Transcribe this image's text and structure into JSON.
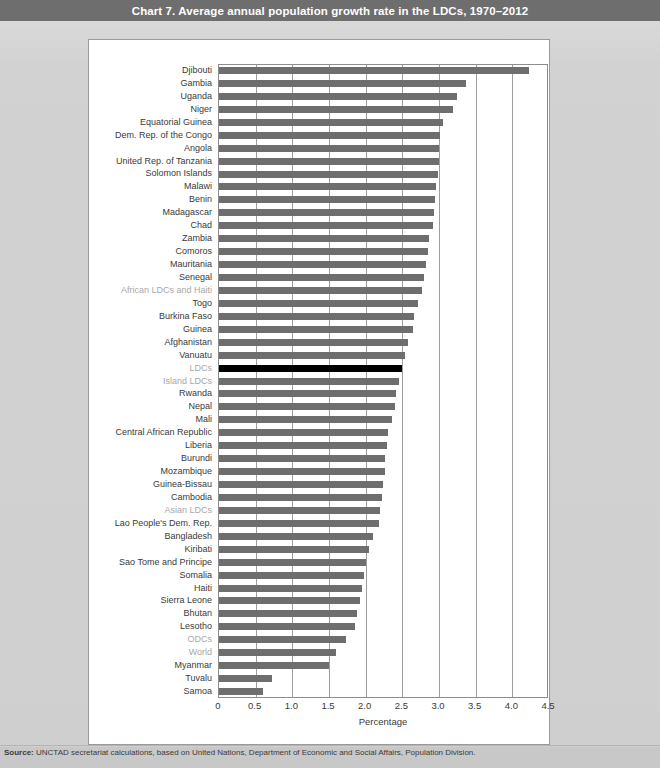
{
  "title": "Chart 7. Average annual population growth rate in the LDCs, 1970–2012",
  "source": {
    "prefix": "Source:",
    "text": "UNCTAD secretariat calculations, based on United Nations, Department of Economic and Social Affairs, Population Division."
  },
  "colors": {
    "title_bar_bg": "#6e6e6e",
    "title_bar_text": "#ffffff",
    "card_bg": "#d2d2d2",
    "plot_bg": "#ffffff",
    "bar": "#6e6e6e",
    "bar_highlight": "#000000",
    "aggregate_label": "#a8a8a8",
    "label": "#3a3a3a",
    "gridline": "#9e9e9e"
  },
  "chart_data": {
    "type": "bar",
    "orientation": "horizontal",
    "title": "Chart 7. Average annual population growth rate in the LDCs, 1970–2012",
    "xlabel": "Percentage",
    "ylabel": "",
    "xlim": [
      0,
      4.5
    ],
    "xticks": [
      "0",
      "0.5",
      "1.0",
      "1.5",
      "2.0",
      "2.5",
      "3.0",
      "3.5",
      "4.0",
      "4.5"
    ],
    "xtick_values": [
      0,
      0.5,
      1.0,
      1.5,
      2.0,
      2.5,
      3.0,
      3.5,
      4.0,
      4.5
    ],
    "grid": true,
    "legend": false,
    "categories": [
      "Djibouti",
      "Gambia",
      "Uganda",
      "Niger",
      "Equatorial Guinea",
      "Dem. Rep. of  the Congo",
      "Angola",
      "United Rep. of Tanzania",
      "Solomon Islands",
      "Malawi",
      "Benin",
      "Madagascar",
      "Chad",
      "Zambia",
      "Comoros",
      "Mauritania",
      "Senegal",
      "African LDCs and Haiti",
      "Togo",
      "Burkina Faso",
      "Guinea",
      "Afghanistan",
      "Vanuatu",
      "LDCs",
      "Island LDCs",
      "Rwanda",
      "Nepal",
      "Mali",
      "Central African Republic",
      "Liberia",
      "Burundi",
      "Mozambique",
      "Guinea-Bissau",
      "Cambodia",
      "Asian LDCs",
      "Lao People's Dem. Rep.",
      "Bangladesh",
      "Kiribati",
      "Sao Tome and Principe",
      "Somalia",
      "Haiti",
      "Sierra Leone",
      "Bhutan",
      "Lesotho",
      "ODCs",
      "World",
      "Myanmar",
      "Tuvalu",
      "Samoa"
    ],
    "values": [
      4.23,
      3.37,
      3.24,
      3.19,
      3.05,
      3.02,
      3.0,
      3.0,
      2.98,
      2.96,
      2.95,
      2.93,
      2.92,
      2.86,
      2.85,
      2.82,
      2.79,
      2.77,
      2.72,
      2.66,
      2.64,
      2.58,
      2.53,
      2.5,
      2.46,
      2.42,
      2.4,
      2.36,
      2.3,
      2.29,
      2.27,
      2.26,
      2.24,
      2.22,
      2.2,
      2.18,
      2.1,
      2.05,
      2.0,
      1.98,
      1.95,
      1.92,
      1.88,
      1.85,
      1.73,
      1.6,
      1.5,
      0.72,
      0.6
    ],
    "aggregates": [
      "African LDCs and Haiti",
      "LDCs",
      "Island LDCs",
      "Asian LDCs",
      "ODCs",
      "World"
    ],
    "highlighted": [
      "LDCs"
    ]
  }
}
